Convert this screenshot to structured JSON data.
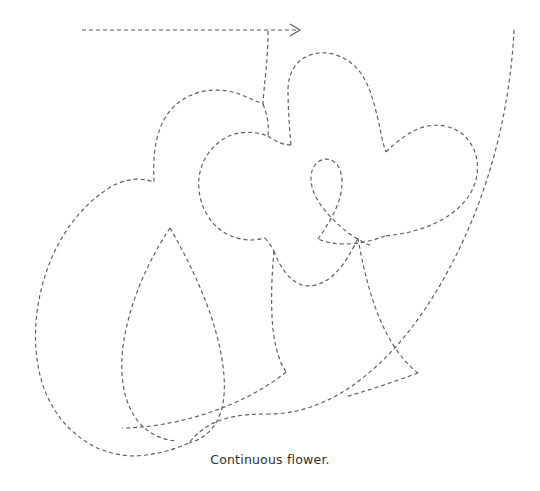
{
  "page": {
    "background_color": "#ffffff",
    "width": 540,
    "height": 491
  },
  "figure": {
    "title": "Continuous flower",
    "caption": "Continuous flower.",
    "caption_color": "#2e2e33",
    "stroke_color": "#5b5b63",
    "stroke_width": 1.15,
    "dash_pattern": "4 3",
    "start_marker": {
      "name": "direction-arrow",
      "from_x": 82,
      "from_y": 30,
      "to_x": 300,
      "to_y": 30,
      "head_size": 9
    },
    "strokes": [
      {
        "name": "lead-in-arrow-line",
        "d": "M 82 30 L 299 30"
      },
      {
        "name": "arrow-head-glyph",
        "d": "M 290 24 L 300 30 L 290 36"
      },
      {
        "name": "upper-left-petal-and-leaf-outer",
        "d": "M 268 31 C 268 62 264 84 263 104 C 250 99 240 93 228 91 C 203 87 178 96 165 118 C 154 137 153 160 154 182 C 139 176 120 180 106 190 C 82 206 62 232 50 262 C 36 297 31 338 40 375 C 47 405 66 432 95 447 C 106 452 118 455 130 456"
      },
      {
        "name": "mid-upper-petal-left-lobe",
        "d": "M 263 104 C 268 116 269 127 268 136 C 254 131 240 131 229 136 C 212 144 201 160 199 178 C 197 199 206 220 222 231 C 235 240 251 242 265 238"
      },
      {
        "name": "petal-notch-join-top",
        "d": "M 268 136 C 276 142 284 145 291 145"
      },
      {
        "name": "upper-right-petal",
        "d": "M 291 145 C 289 124 288 104 288 90 C 288 73 296 60 310 55 C 327 49 348 56 360 72 C 371 87 375 107 380 128 C 382 139 384 147 386 152"
      },
      {
        "name": "right-petal-upper-edge",
        "d": "M 386 152 C 395 143 406 134 418 129 C 437 121 458 126 469 141 C 481 157 480 180 468 197 C 456 214 437 224 417 230 C 404 234 393 235 385 236"
      },
      {
        "name": "right-petal-lower-return",
        "d": "M 385 236 C 372 241 358 244 345 244 C 334 244 325 242 318 239"
      },
      {
        "name": "center-small-loop",
        "d": "M 318 239 C 325 229 332 218 337 206 C 343 191 344 176 338 166 C 332 157 321 157 315 165 C 309 173 310 186 316 197 C 321 207 330 217 340 226 C 350 235 361 242 372 246"
      },
      {
        "name": "petal-base-left-seam",
        "d": "M 265 238 C 269 243 272 247 274 251"
      },
      {
        "name": "stem-left-edge",
        "d": "M 274 251 C 272 272 271 294 272 316 C 273 338 277 358 286 372"
      },
      {
        "name": "inner-calyx-arc",
        "d": "M 274 251 C 280 268 290 281 302 285 C 316 289 332 280 344 263 C 350 254 355 245 358 238"
      },
      {
        "name": "stem-right-edge",
        "d": "M 358 238 C 362 262 368 288 377 312 C 387 338 401 360 418 373"
      },
      {
        "name": "lower-sweep-from-stem",
        "d": "M 286 372 C 264 390 236 404 205 414 C 173 424 143 428 122 428"
      },
      {
        "name": "inner-leaf-left",
        "d": "M 170 228 C 152 255 135 290 127 325 C 118 362 120 397 137 420 C 147 433 161 440 177 441"
      },
      {
        "name": "inner-leaf-right",
        "d": "M 170 228 C 184 252 199 282 210 313 C 222 348 228 383 222 408 C 217 427 205 439 189 443"
      },
      {
        "name": "outer-leaf-bottom-close",
        "d": "M 130 456 C 151 456 171 451 189 443"
      },
      {
        "name": "long-right-sweep",
        "d": "M 514 30 C 512 72 505 118 492 163 C 477 215 454 266 425 309 C 403 342 377 369 349 388 C 322 406 294 414 270 414"
      },
      {
        "name": "sweep-tail-join",
        "d": "M 270 414 C 240 414 210 416 189 443"
      },
      {
        "name": "right-sweep-inner-return",
        "d": "M 418 373 C 396 381 370 390 345 397"
      }
    ]
  }
}
